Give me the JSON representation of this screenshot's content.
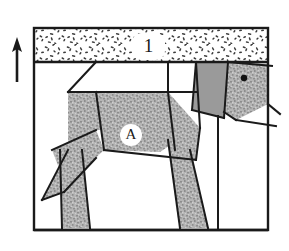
{
  "figure": {
    "kind": "geometric-dog-diagram",
    "canvas": {
      "width": 289,
      "height": 251,
      "background": "#ffffff"
    },
    "frame": {
      "name": "outer-frame",
      "x": 34,
      "y": 28,
      "width": 234,
      "height": 202,
      "stroke": "#1a1a1a",
      "stroke_width": 2,
      "fill": "none"
    },
    "colors": {
      "line": "#1a1a1a",
      "stipple_band_fill": "#ffffff",
      "stipple_dot": "#3a3a3a",
      "body_speckle_base": "#b0b0b0",
      "body_speckle_dot": "#8a8a8a",
      "ear_solid": "#9a9a9a",
      "label_plate": "#ffffff",
      "page_background": "#ffffff"
    },
    "labels": [
      {
        "name": "band-label-1",
        "text": "1",
        "x": 148,
        "y": 46,
        "style": "number",
        "plate": {
          "shape": "rounded-rect",
          "x": 132,
          "y": 33,
          "width": 33,
          "height": 27,
          "rx": 9
        }
      },
      {
        "name": "body-label-a",
        "text": "A",
        "x": 131,
        "y": 135,
        "style": "letter",
        "plate": {
          "shape": "circle",
          "cx": 131,
          "cy": 135,
          "r": 11
        }
      }
    ],
    "arrow": {
      "name": "up-arrow",
      "description": "thin upward pointing arrow at the left margin outside the frame",
      "tip_x": 17,
      "tip_y": 42,
      "tail_x": 17,
      "tail_y": 82,
      "head_half_width": 5,
      "head_length": 12,
      "stroke": "#1a1a1a",
      "stroke_width": 2
    },
    "bands": [
      {
        "name": "stipple-band",
        "description": "speckled horizontal strip across the top of the frame labelled 1",
        "x": 34,
        "y": 28,
        "width": 234,
        "height": 34,
        "fill": "#ffffff",
        "pattern": "stipple"
      }
    ],
    "baselines": [
      {
        "name": "band-bottom-rule",
        "x1": 34,
        "y1": 62,
        "x2": 268,
        "y2": 62,
        "stroke_width": 2
      },
      {
        "name": "ground-rule",
        "x1": 34,
        "y1": 230,
        "x2": 268,
        "y2": 230,
        "stroke_width": 2
      }
    ],
    "shapes": [
      {
        "name": "back-body-panel",
        "role": "dog-back-upper-body",
        "fill": "speckle",
        "points": "68,92 168,92 168,130 96,130 68,150"
      },
      {
        "name": "mid-body-panel",
        "role": "dog-torso",
        "fill": "speckle",
        "points": "96,92 168,92 175,142 160,152 104,150"
      },
      {
        "name": "chest-panel",
        "role": "dog-chest-shoulder",
        "fill": "speckle",
        "points": "168,92 200,128 196,160 175,150"
      },
      {
        "name": "haunch-panel",
        "role": "dog-rear-haunch",
        "fill": "speckle",
        "points": "52,150 96,130 104,150 66,186"
      },
      {
        "name": "tail-panel",
        "role": "dog-tail",
        "fill": "speckle",
        "points": "68,150 96,158 64,192 42,200"
      },
      {
        "name": "front-leg",
        "role": "dog-front-leg",
        "fill": "speckle",
        "points": "60,150 82,150 90,228 62,228"
      },
      {
        "name": "rear-leg",
        "role": "dog-rear-leg",
        "fill": "speckle",
        "points": "168,140 190,150 208,228 180,228"
      },
      {
        "name": "ear-panel",
        "role": "dog-ear",
        "fill": "solid-gray",
        "points": "196,62 228,62 224,118 192,110"
      },
      {
        "name": "head-panel",
        "role": "dog-head-face",
        "fill": "speckle",
        "points": "228,62 268,64 268,104 236,120 224,112"
      },
      {
        "name": "muzzle-panel",
        "role": "dog-muzzle",
        "fill": "none",
        "points": "236,120 268,104 268,126"
      }
    ],
    "creases": [
      {
        "name": "crease-neck-top",
        "x1": 168,
        "y1": 62,
        "x2": 168,
        "y2": 92
      },
      {
        "name": "crease-back-left",
        "x1": 96,
        "y1": 62,
        "x2": 68,
        "y2": 92
      },
      {
        "name": "crease-body-top",
        "x1": 68,
        "y1": 92,
        "x2": 196,
        "y2": 92
      },
      {
        "name": "crease-torso-left",
        "x1": 96,
        "y1": 92,
        "x2": 104,
        "y2": 150
      },
      {
        "name": "crease-torso-right",
        "x1": 168,
        "y1": 92,
        "x2": 175,
        "y2": 150
      },
      {
        "name": "crease-belly",
        "x1": 104,
        "y1": 150,
        "x2": 196,
        "y2": 160
      },
      {
        "name": "crease-haunch",
        "x1": 96,
        "y1": 130,
        "x2": 52,
        "y2": 150
      },
      {
        "name": "crease-tail-upper",
        "x1": 68,
        "y1": 150,
        "x2": 42,
        "y2": 200
      },
      {
        "name": "crease-tail-lower",
        "x1": 96,
        "y1": 158,
        "x2": 64,
        "y2": 192
      },
      {
        "name": "crease-front-leg-in",
        "x1": 82,
        "y1": 150,
        "x2": 90,
        "y2": 228
      },
      {
        "name": "crease-front-leg-out",
        "x1": 60,
        "y1": 150,
        "x2": 62,
        "y2": 228
      },
      {
        "name": "crease-rear-leg-in",
        "x1": 190,
        "y1": 150,
        "x2": 208,
        "y2": 228
      },
      {
        "name": "crease-rear-leg-out",
        "x1": 168,
        "y1": 140,
        "x2": 180,
        "y2": 228
      },
      {
        "name": "crease-shoulder",
        "x1": 196,
        "y1": 62,
        "x2": 200,
        "y2": 128
      },
      {
        "name": "crease-ear-front",
        "x1": 228,
        "y1": 62,
        "x2": 224,
        "y2": 118
      },
      {
        "name": "crease-chest-lower",
        "x1": 200,
        "y1": 128,
        "x2": 196,
        "y2": 160
      },
      {
        "name": "crease-jaw",
        "x1": 236,
        "y1": 120,
        "x2": 268,
        "y2": 126
      },
      {
        "name": "crease-head-lower",
        "x1": 224,
        "y1": 112,
        "x2": 236,
        "y2": 120
      },
      {
        "name": "crease-right-column",
        "x1": 218,
        "y1": 116,
        "x2": 218,
        "y2": 230
      }
    ],
    "eye": {
      "name": "dog-eye",
      "cx": 244,
      "cy": 78,
      "r": 3.2,
      "fill": "#111111"
    }
  }
}
